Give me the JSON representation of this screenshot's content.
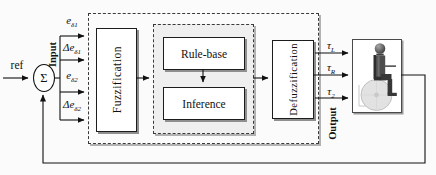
{
  "diagram": {
    "title_hint": "fuzzy-logic-controller-block-diagram",
    "reference_label": "ref",
    "summation": {
      "symbol": "Σ"
    },
    "input_group_label": "Input",
    "inputs": [
      {
        "base": "e",
        "sub": "δ1"
      },
      {
        "base": "Δe",
        "sub": "δ1"
      },
      {
        "base": "e",
        "sub": "δ2"
      },
      {
        "base": "Δe",
        "sub": "δ2"
      }
    ],
    "blocks": {
      "fuzzification": "Fuzzification",
      "rule_base": "Rule-base",
      "inference": "Inference",
      "defuzzification": "Defuzzification"
    },
    "output_group_label": "Output",
    "outputs": [
      {
        "base": "τ",
        "sub": "L"
      },
      {
        "base": "τ",
        "sub": "R"
      },
      {
        "base": "τ",
        "sub": "2"
      }
    ],
    "plant": {
      "icon": "wheelchair-rider-icon"
    },
    "colors": {
      "line": "#111111",
      "box_border": "#1c1c1c",
      "box_shadow": "#8f8f8f",
      "inner_panel_fill": "#efefef",
      "background": "#fbfbfb",
      "wheel_fill": "#e2e2e2",
      "rider_fill": "#4d4d4d"
    }
  }
}
